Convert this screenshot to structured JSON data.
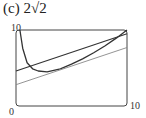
{
  "title": "(c)  2√2",
  "chart_data": {
    "type": "line",
    "title": "(c) 2√2",
    "xlabel": "",
    "ylabel": "",
    "xlim": [
      0,
      10
    ],
    "ylim": [
      0,
      10
    ],
    "x_tick_labels": [
      "0",
      "10"
    ],
    "y_tick_labels": [
      "10"
    ],
    "grid": false,
    "legend": null,
    "series": [
      {
        "name": "curve",
        "description": "decreasing then increasing curve with a vertical asymptote near x=0",
        "x": [
          0.35,
          0.6,
          1.0,
          1.5,
          2.0,
          2.8,
          4.0,
          5.0,
          6.0,
          7.0,
          8.0,
          9.0,
          10.0
        ],
        "values": [
          10,
          7.6,
          5.7,
          4.9,
          4.6,
          4.5,
          4.9,
          5.5,
          6.2,
          7.0,
          7.9,
          8.9,
          10.0
        ]
      },
      {
        "name": "upper line",
        "x": [
          0,
          10
        ],
        "values": [
          4.6,
          9.5
        ]
      },
      {
        "name": "lower line",
        "x": [
          0,
          10
        ],
        "values": [
          2.8,
          7.7
        ]
      }
    ]
  },
  "colors": {
    "curve": "#333333",
    "upper_line": "#333333",
    "lower_line": "#888888",
    "frame": "#444444"
  }
}
